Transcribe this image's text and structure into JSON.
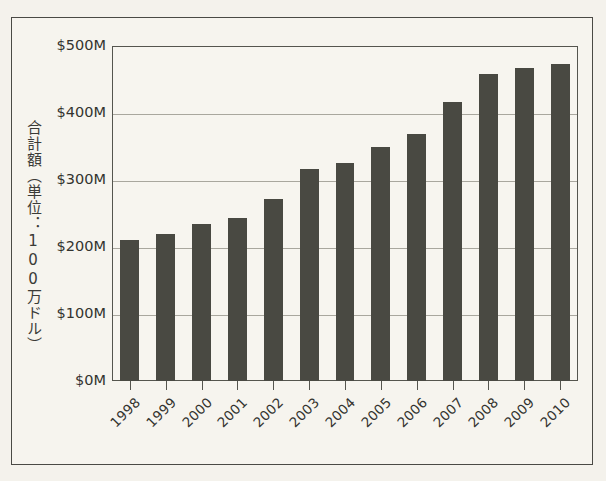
{
  "page": {
    "background_color": "#f4f2ec",
    "frame_color": "#4a4a45",
    "cut_text_top": "",
    "cut_text_bottom": ""
  },
  "chart_data": {
    "type": "bar",
    "title": "",
    "xlabel": "",
    "ylabel": "合計額（単位：100万ドル）",
    "categories": [
      "1998",
      "1999",
      "2000",
      "2001",
      "2002",
      "2003",
      "2004",
      "2005",
      "2006",
      "2007",
      "2008",
      "2009",
      "2010"
    ],
    "values": [
      211,
      219,
      234,
      243,
      271,
      316,
      325,
      350,
      368,
      417,
      458,
      467,
      473
    ],
    "ylim": [
      0,
      500
    ],
    "ytick_values": [
      0,
      100,
      200,
      300,
      400,
      500
    ],
    "ytick_labels": [
      "$0M",
      "$100M",
      "$200M",
      "$300M",
      "$400M",
      "$500M"
    ],
    "grid": true,
    "grid_axis": "y",
    "legend": null,
    "bar_color": "#494942",
    "gridline_color": "#a9a79e",
    "plot_background": "#f7f5ef",
    "series": [
      {
        "name": "合計額",
        "values": [
          211,
          219,
          234,
          243,
          271,
          316,
          325,
          350,
          368,
          417,
          458,
          467,
          473
        ]
      }
    ]
  }
}
